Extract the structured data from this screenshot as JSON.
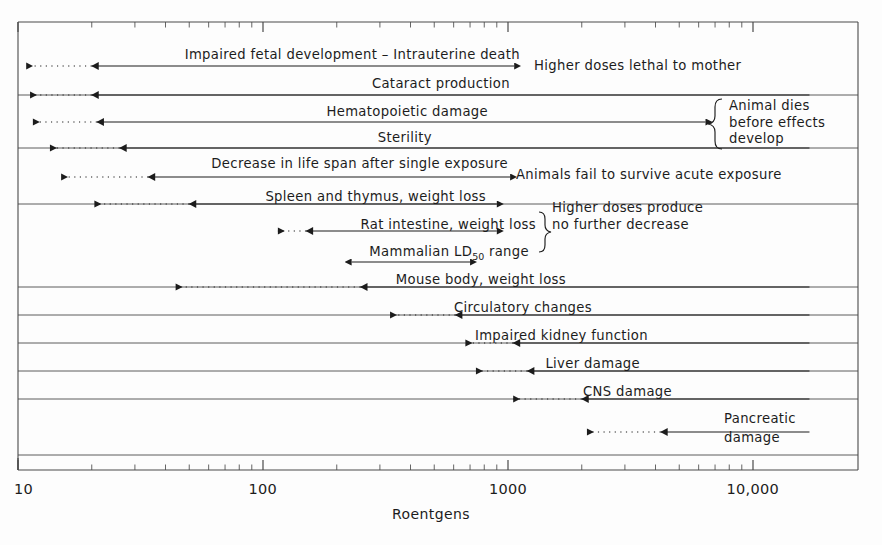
{
  "chart_data": {
    "type": "bar",
    "title": "",
    "xlabel": "Roentgens",
    "ylabel": "",
    "scale": "log",
    "xlim": [
      10,
      17000
    ],
    "grid": false,
    "legend": null,
    "axis_ticks": [
      {
        "value": 10,
        "label": "10"
      },
      {
        "value": 100,
        "label": "100"
      },
      {
        "value": 1000,
        "label": "1000"
      },
      {
        "value": 10000,
        "label": "10,000"
      }
    ],
    "categories": [
      "Impaired fetal development – Intrauterine death",
      "Cataract production",
      "Hematopoietic damage",
      "Sterility",
      "Decrease in life span after single exposure",
      "Spleen and thymus, weight loss",
      "Rat intestine, weight loss",
      "Mammalian LD50 range",
      "Mouse body, weight loss",
      "Circulatory changes",
      "Impaired kidney function",
      "Liver damage",
      "CNS damage",
      "Pancreatic damage"
    ],
    "ranges": [
      {
        "label": "Impaired fetal development – Intrauterine death",
        "solid_from": 20,
        "solid_to": 1060,
        "dotted_from": 10.8,
        "dotted_to": 20
      },
      {
        "label": "Cataract production",
        "solid_from": 20,
        "solid_to": 17000,
        "dotted_from": 11.2,
        "dotted_to": 20
      },
      {
        "label": "Hematopoietic damage",
        "solid_from": 21,
        "solid_to": 6400,
        "dotted_from": 11.5,
        "dotted_to": 21
      },
      {
        "label": "Sterility",
        "solid_from": 26,
        "solid_to": 17000,
        "dotted_from": 13.5,
        "dotted_to": 26
      },
      {
        "label": "Decrease in life span after single exposure",
        "solid_from": 34,
        "solid_to": 1020,
        "dotted_from": 15,
        "dotted_to": 34
      },
      {
        "label": "Spleen and thymus, weight loss",
        "solid_from": 50,
        "solid_to": 900,
        "dotted_from": 20.5,
        "dotted_to": 50
      },
      {
        "label": "Rat intestine, weight loss",
        "solid_from": 150,
        "solid_to": 900,
        "dotted_from": 115,
        "dotted_to": 150
      },
      {
        "label": "Mammalian LD50 range",
        "solid_from": 230,
        "solid_to": 700,
        "dotted_from": null,
        "dotted_to": null
      },
      {
        "label": "Mouse body, weight loss",
        "solid_from": 250,
        "solid_to": 17000,
        "dotted_from": 44,
        "dotted_to": 250
      },
      {
        "label": "Circulatory changes",
        "solid_from": 610,
        "solid_to": 17000,
        "dotted_from": 330,
        "dotted_to": 610
      },
      {
        "label": "Impaired kidney function",
        "solid_from": 1050,
        "solid_to": 17000,
        "dotted_from": 670,
        "dotted_to": 1050
      },
      {
        "label": "Liver damage",
        "solid_from": 1200,
        "solid_to": 17000,
        "dotted_from": 740,
        "dotted_to": 1200
      },
      {
        "label": "CNS damage",
        "solid_from": 2000,
        "solid_to": 17000,
        "dotted_from": 1050,
        "dotted_to": 2000
      },
      {
        "label": "Pancreatic damage",
        "solid_from": 4200,
        "solid_to": 17000,
        "dotted_from": 2100,
        "dotted_to": 4200
      }
    ],
    "annotations": [
      {
        "text": "Higher doses lethal to mother",
        "at_value": 1060,
        "row": 0
      },
      {
        "text": "Animal dies before effects develop",
        "at_value": 6400,
        "row": 2,
        "brace": true
      },
      {
        "text": "Animals fail to survive acute exposure",
        "at_value": 1020,
        "row": 4
      },
      {
        "text": "Higher doses produce no further decrease",
        "at_value": 900,
        "rows": [
          5,
          6
        ],
        "brace": true
      }
    ]
  },
  "axis": {
    "title": "Roentgens",
    "tick_labels": [
      "10",
      "100",
      "1000",
      "10,000"
    ]
  },
  "rows": [
    {
      "label": "Impaired fetal development – Intrauterine death"
    },
    {
      "label": "Cataract production"
    },
    {
      "label": "Hematopoietic damage"
    },
    {
      "label": "Sterility"
    },
    {
      "label": "Decrease in life span after single exposure"
    },
    {
      "label": "Spleen and thymus, weight loss"
    },
    {
      "label": "Rat intestine, weight loss"
    },
    {
      "label": "Mammalian LD"
    },
    {
      "label": "Mouse body, weight loss"
    },
    {
      "label": "Circulatory changes"
    },
    {
      "label": "Impaired kidney function"
    },
    {
      "label": "Liver damage"
    },
    {
      "label": "CNS damage"
    },
    {
      "label": "Pancreatic"
    }
  ],
  "labels": {
    "ld50_prefix": "Mammalian LD",
    "ld50_sub": "50",
    "ld50_suffix": " range",
    "pancreatic_line1": "Pancreatic",
    "pancreatic_line2": "damage"
  },
  "annotations": {
    "higher_doses_lethal": "Higher doses lethal to mother",
    "animal_dies_l1": "Animal dies",
    "animal_dies_l2": "before effects",
    "animal_dies_l3": "develop",
    "animals_fail": "Animals fail to survive acute exposure",
    "higher_doses_produce_l1": "Higher doses produce",
    "higher_doses_produce_l2": "no further decrease"
  },
  "colors": {
    "ink": "#1c1c1c",
    "frame": "#4a4a4a",
    "background": "#fdfdfd"
  }
}
